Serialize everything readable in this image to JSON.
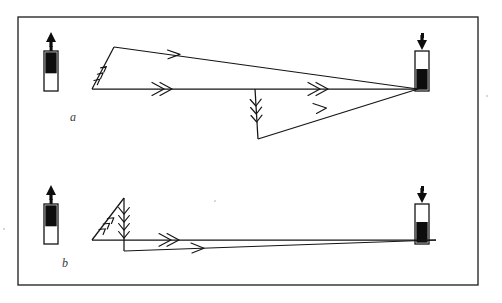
{
  "figure": {
    "background_color": "#ffffff",
    "ink_color": "#141414",
    "frame_color": "#2b2b2b",
    "width": 502,
    "height": 303,
    "frame": {
      "x": 18,
      "y": 17,
      "width": 460,
      "height": 268
    }
  },
  "panels": [
    {
      "id": "a",
      "label": "a",
      "label_position": {
        "x": 70,
        "y": 121
      },
      "left_symbol": {
        "name": "up-arrow-bar-symbol",
        "direction": "up",
        "fill_position": "top",
        "fill_fraction": 0.55,
        "x": 45,
        "y": 33
      },
      "right_symbol": {
        "name": "down-arrow-bar-symbol",
        "direction": "down",
        "fill_position": "bottom",
        "fill_fraction": 0.55,
        "x": 416,
        "y": 33
      },
      "vertices": {
        "origin": {
          "x": 92,
          "y": 89
        },
        "apex": {
          "x": 114,
          "y": 47
        },
        "right_node": {
          "x": 418,
          "y": 89
        },
        "dip": {
          "x": 258,
          "y": 139
        },
        "mid_top": {
          "x": 255,
          "y": 89
        }
      },
      "segments": [
        {
          "name": "rising-diagonal",
          "from": "origin",
          "to": "apex",
          "arrowheads": 3,
          "direction": "up-right"
        },
        {
          "name": "upper-descending",
          "from": "apex",
          "to": "right_node",
          "arrowheads": 1,
          "direction": "right-down"
        },
        {
          "name": "lower-horizontal",
          "from": "origin",
          "to": "mid_top",
          "arrowheads": 2,
          "direction": "right"
        },
        {
          "name": "mid-horizontal",
          "from": "mid_top",
          "to": "right_node",
          "arrowheads": 2,
          "direction": "right"
        },
        {
          "name": "vertical-drop",
          "from": "mid_top",
          "to": "dip",
          "arrowheads": 3,
          "direction": "down"
        },
        {
          "name": "recovery-diagonal",
          "from": "dip",
          "to": "right_node",
          "arrowheads": 1,
          "direction": "up-right"
        }
      ]
    },
    {
      "id": "b",
      "label": "b",
      "label_position": {
        "x": 62,
        "y": 267
      },
      "left_symbol": {
        "name": "up-arrow-bar-symbol",
        "direction": "up",
        "fill_position": "top",
        "fill_fraction": 0.55,
        "x": 45,
        "y": 186
      },
      "right_symbol": {
        "name": "down-arrow-bar-symbol",
        "direction": "down",
        "fill_position": "bottom",
        "fill_fraction": 0.55,
        "x": 416,
        "y": 186
      },
      "vertices": {
        "origin": {
          "x": 92,
          "y": 240
        },
        "apex": {
          "x": 124,
          "y": 198
        },
        "mid_top": {
          "x": 124,
          "y": 240
        },
        "mid_low": {
          "x": 124,
          "y": 251
        },
        "right_node": {
          "x": 430,
          "y": 240
        },
        "right_low": {
          "x": 430,
          "y": 242
        }
      },
      "segments": [
        {
          "name": "rising-diagonal",
          "from": "origin",
          "to": "apex",
          "arrowheads": 3,
          "direction": "up-right"
        },
        {
          "name": "vertical-drop",
          "from": "apex",
          "to": "mid_low",
          "arrowheads": 3,
          "direction": "down"
        },
        {
          "name": "upper-horizontal",
          "from": "origin",
          "to": "right_node",
          "arrowheads": 2,
          "direction": "right"
        },
        {
          "name": "lower-horizontal",
          "from": "mid_low",
          "to": "right_low",
          "arrowheads": 1,
          "direction": "right"
        }
      ]
    }
  ]
}
